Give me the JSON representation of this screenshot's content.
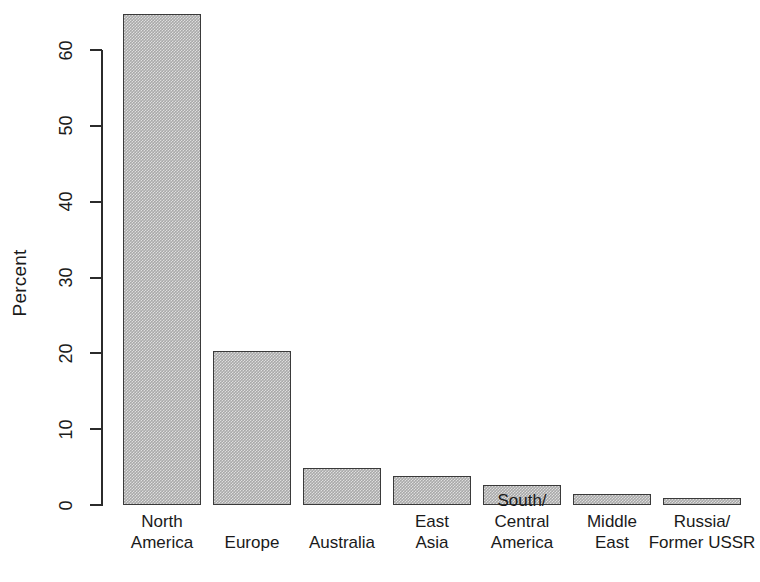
{
  "chart_data": {
    "type": "bar",
    "title": "",
    "xlabel": "",
    "ylabel": "Percent",
    "categories": [
      "North\nAmerica",
      "Europe",
      "Australia",
      "East\nAsia",
      "South/\nCentral\nAmerica",
      "Middle\nEast",
      "Russia/\nFormer USSR"
    ],
    "values": [
      64.8,
      20.3,
      4.9,
      3.8,
      2.6,
      1.4,
      0.9
    ],
    "ylim": [
      0,
      65
    ],
    "yticks": [
      0,
      10,
      20,
      30,
      40,
      50,
      60
    ],
    "ytick_labels": [
      "0",
      "10",
      "20",
      "30",
      "40",
      "50",
      "60"
    ],
    "grid": false,
    "legend": false,
    "bar_fill_color": "#a9a9a9",
    "bar_border_color": "#3a3a3a",
    "axis_color": "#2b2b2b",
    "background_color": "#ffffff"
  }
}
